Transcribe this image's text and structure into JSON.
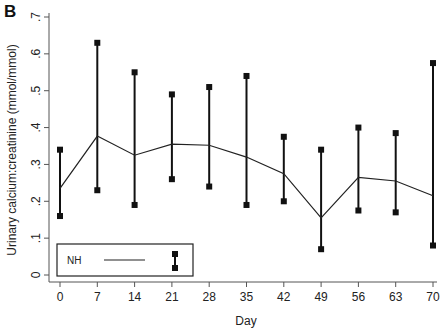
{
  "panel_label": "B",
  "chart_data": {
    "type": "line",
    "title": "",
    "xlabel": "Day",
    "ylabel": "Urinary calcium:creatinine (mmol/mmol)",
    "x": [
      0,
      7,
      14,
      21,
      28,
      35,
      42,
      49,
      56,
      63,
      70
    ],
    "x_ticks": [
      "0",
      "7",
      "14",
      "21",
      "28",
      "35",
      "42",
      "49",
      "56",
      "63",
      "70"
    ],
    "y_ticks": [
      "0",
      ".1",
      ".2",
      ".3",
      ".4",
      ".5",
      ".6",
      ".7"
    ],
    "ylim": [
      0,
      0.7
    ],
    "xlim": [
      0,
      70
    ],
    "grid": false,
    "legend_position": "bottom-left-inside",
    "series": [
      {
        "name": "NH",
        "type": "line",
        "values": [
          0.235,
          0.377,
          0.325,
          0.355,
          0.352,
          0.32,
          0.275,
          0.155,
          0.265,
          0.255,
          0.215
        ]
      },
      {
        "name": "NH range",
        "type": "range-bar",
        "upper": [
          0.34,
          0.63,
          0.55,
          0.49,
          0.51,
          0.54,
          0.375,
          0.34,
          0.4,
          0.385,
          0.575
        ],
        "lower": [
          0.16,
          0.23,
          0.19,
          0.26,
          0.24,
          0.19,
          0.2,
          0.07,
          0.175,
          0.17,
          0.08
        ]
      }
    ],
    "legend": [
      {
        "label": "NH",
        "symbols": [
          "line",
          "range-bar"
        ]
      }
    ]
  }
}
